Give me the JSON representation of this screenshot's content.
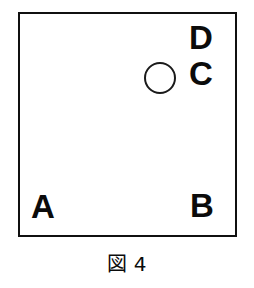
{
  "figure": {
    "caption": "図 4",
    "frame": {
      "name": "square-boundary",
      "stroke_color": "#101010",
      "fill_color": "#ffffff",
      "stroke_width_px": 2
    },
    "marker": {
      "name": "circle-marker",
      "shape": "circle",
      "filled": false,
      "stroke_color": "#1a1a1a"
    },
    "labels": [
      {
        "id": "d",
        "text": "D",
        "position": "top-right-upper"
      },
      {
        "id": "c",
        "text": "C",
        "position": "top-right-lower"
      },
      {
        "id": "a",
        "text": "A",
        "position": "bottom-left"
      },
      {
        "id": "b",
        "text": "B",
        "position": "bottom-right"
      }
    ],
    "label_color": "#0b0b0b"
  }
}
